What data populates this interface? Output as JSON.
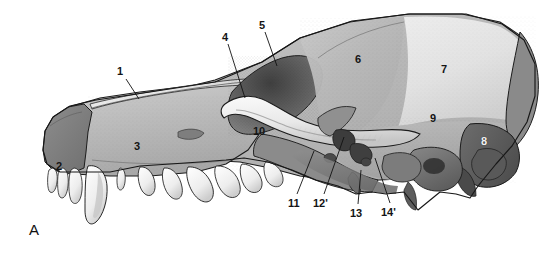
{
  "figure": {
    "panel_letter": "A",
    "caption_title": "Skull of the dog, lateral view",
    "background_color": "#ffffff",
    "label_color": "#141414",
    "label_color_inverse": "#f2f2f2",
    "width": 560,
    "height": 254
  },
  "palette": {
    "outline": "#1c1c1c",
    "bone_light": "#d9d9d9",
    "bone_mid": "#b4b4b4",
    "bone_mid_dark": "#9a9a9a",
    "bone_dark": "#7a7a7a",
    "bone_darkest": "#5c5c5c",
    "highlight": "#efefef",
    "teeth": "#f6f6f4",
    "zygomatic": "#8f8f8f",
    "frontal_pale": "#e6e6e6"
  },
  "labels": [
    {
      "id": "1",
      "text": "1",
      "x": 117,
      "y": 66,
      "anchor": "nasal-bone-dorsal-margin",
      "leader": {
        "x1": 126,
        "y1": 79,
        "x2": 139,
        "y2": 99
      }
    },
    {
      "id": "2",
      "text": "2",
      "x": 56,
      "y": 161,
      "anchor": "incisive-bone",
      "leader": null
    },
    {
      "id": "3",
      "text": "3",
      "x": 134,
      "y": 141,
      "anchor": "maxilla",
      "leader": null
    },
    {
      "id": "4",
      "text": "4",
      "x": 222,
      "y": 32,
      "anchor": "lacrimal-region",
      "leader": {
        "x1": 228,
        "y1": 44,
        "x2": 245,
        "y2": 98
      }
    },
    {
      "id": "5",
      "text": "5",
      "x": 259,
      "y": 20,
      "anchor": "frontal-bone-orbital-part",
      "leader": {
        "x1": 265,
        "y1": 32,
        "x2": 277,
        "y2": 66
      }
    },
    {
      "id": "6",
      "text": "6",
      "x": 355,
      "y": 54,
      "anchor": "frontal-bone",
      "leader": null
    },
    {
      "id": "7",
      "text": "7",
      "x": 441,
      "y": 64,
      "anchor": "parietal-bone",
      "leader": null
    },
    {
      "id": "8",
      "text": "8",
      "x": 481,
      "y": 136,
      "anchor": "occipital-bone",
      "leader": null,
      "style": "white"
    },
    {
      "id": "9",
      "text": "9",
      "x": 430,
      "y": 113,
      "anchor": "temporal-bone-squamous-part",
      "leader": null
    },
    {
      "id": "10",
      "text": "10",
      "x": 253,
      "y": 126,
      "anchor": "zygomatic-arch",
      "leader": null
    },
    {
      "id": "11",
      "text": "11",
      "x": 288,
      "y": 198,
      "anchor": "orbital-floor",
      "leader": {
        "x1": 297,
        "y1": 194,
        "x2": 314,
        "y2": 151
      }
    },
    {
      "id": "12'",
      "text": "12'",
      "x": 313,
      "y": 198,
      "anchor": "optic-canal",
      "leader": {
        "x1": 324,
        "y1": 194,
        "x2": 344,
        "y2": 137
      }
    },
    {
      "id": "13",
      "text": "13",
      "x": 350,
      "y": 208,
      "anchor": "pterygoid-process",
      "leader": {
        "x1": 358,
        "y1": 204,
        "x2": 361,
        "y2": 170
      }
    },
    {
      "id": "14'",
      "text": "14'",
      "x": 381,
      "y": 207,
      "anchor": "foramen-ovale-region",
      "leader": {
        "x1": 390,
        "y1": 203,
        "x2": 375,
        "y2": 158
      }
    }
  ],
  "teeth": {
    "count_visible": 13,
    "description": "upper dental arcade: incisors, canine, premolars and molars"
  }
}
